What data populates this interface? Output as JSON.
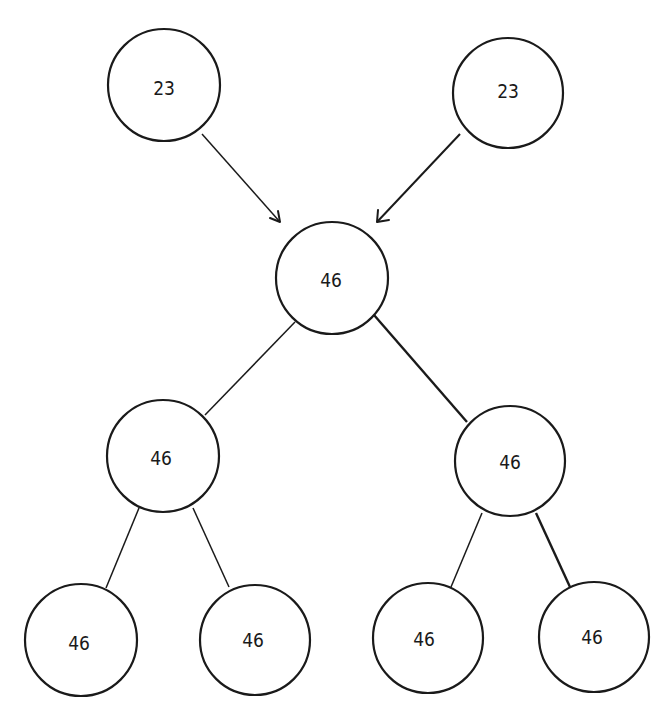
{
  "diagram": {
    "type": "tree",
    "colors": {
      "stroke": "#1a1a1a",
      "fill": "#ffffff",
      "background": "#ffffff"
    },
    "nodes": [
      {
        "id": "input-left",
        "label": "23",
        "cx": 164,
        "cy": 85,
        "r": 56
      },
      {
        "id": "input-right",
        "label": "23",
        "cx": 508,
        "cy": 93,
        "r": 55
      },
      {
        "id": "root",
        "label": "46",
        "cx": 332,
        "cy": 278,
        "r": 56
      },
      {
        "id": "mid-left",
        "label": "46",
        "cx": 163,
        "cy": 456,
        "r": 56
      },
      {
        "id": "mid-right",
        "label": "46",
        "cx": 510,
        "cy": 461,
        "r": 55
      },
      {
        "id": "leaf-1",
        "label": "46",
        "cx": 81,
        "cy": 640,
        "r": 56
      },
      {
        "id": "leaf-2",
        "label": "46",
        "cx": 255,
        "cy": 640,
        "r": 55
      },
      {
        "id": "leaf-3",
        "label": "46",
        "cx": 428,
        "cy": 638,
        "r": 55
      },
      {
        "id": "leaf-4",
        "label": "46",
        "cx": 594,
        "cy": 637,
        "r": 55
      }
    ],
    "arrows": [
      {
        "from": "input-left",
        "to": "root",
        "type": "directed"
      },
      {
        "from": "input-right",
        "to": "root",
        "type": "directed"
      }
    ],
    "edges": [
      {
        "from": "root",
        "to": "mid-left",
        "type": "undirected"
      },
      {
        "from": "root",
        "to": "mid-right",
        "type": "undirected"
      },
      {
        "from": "mid-left",
        "to": "leaf-1",
        "type": "undirected"
      },
      {
        "from": "mid-left",
        "to": "leaf-2",
        "type": "undirected"
      },
      {
        "from": "mid-right",
        "to": "leaf-3",
        "type": "undirected"
      },
      {
        "from": "mid-right",
        "to": "leaf-4",
        "type": "undirected"
      }
    ]
  },
  "labels": {
    "input_left": "23",
    "input_right": "23",
    "root": "46",
    "mid_left": "46",
    "mid_right": "46",
    "leaf_1": "46",
    "leaf_2": "46",
    "leaf_3": "46",
    "leaf_4": "46"
  }
}
